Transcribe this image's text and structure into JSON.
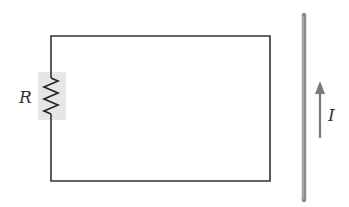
{
  "diagram": {
    "resistor": {
      "label": "R",
      "highlight_color": "#e6e6e6"
    },
    "wire": {
      "color": "#8c8c8c"
    },
    "current": {
      "label": "I",
      "direction": "up",
      "arrow_color": "#7a7a7a"
    },
    "circuit_color": "#333333"
  }
}
